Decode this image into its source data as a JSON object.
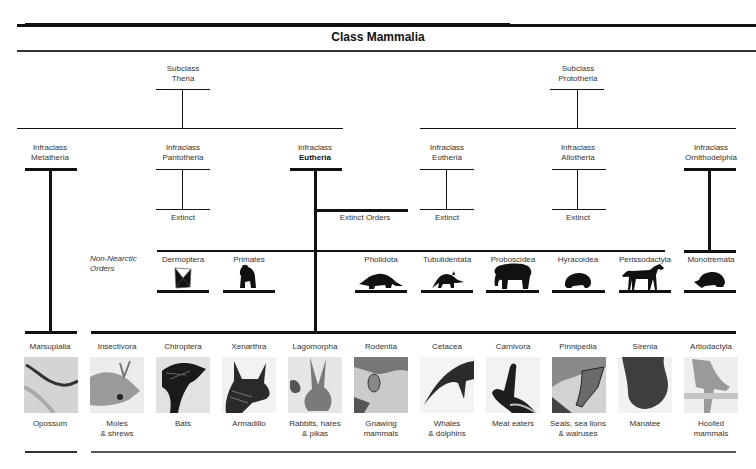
{
  "title": "Class Mammalia",
  "subclasses": [
    {
      "prefix": "Subclass",
      "name": "Theria"
    },
    {
      "prefix": "Subclass",
      "name": "Prototheria"
    }
  ],
  "infraclasses": [
    {
      "prefix": "Infraclass",
      "name": "Metatheria"
    },
    {
      "prefix": "Infraclass",
      "name": "Pantotheria",
      "note": "Extinct"
    },
    {
      "prefix": "Infraclass",
      "name": "Eutheria",
      "note": "Extinct Orders"
    },
    {
      "prefix": "Infraclass",
      "name": "Eotheria",
      "note": "Extinct"
    },
    {
      "prefix": "Infraclass",
      "name": "Allotheria",
      "note": "Extinct"
    },
    {
      "prefix": "Infraclass",
      "name": "Ornithodelphia"
    }
  ],
  "non_nearctic": {
    "label_line1": "Non-Nearctic",
    "label_line2": "Orders",
    "orders": [
      {
        "name": "Dermoptera",
        "icon": "colugo-icon"
      },
      {
        "name": "Primates",
        "icon": "gorilla-icon"
      },
      {
        "name": "Pholidota",
        "icon": "pangolin-icon"
      },
      {
        "name": "Tubulidentata",
        "icon": "aardvark-icon"
      },
      {
        "name": "Proboscidea",
        "icon": "elephant-icon"
      },
      {
        "name": "Hyracoidea",
        "icon": "hyrax-icon"
      },
      {
        "name": "Perissodactyla",
        "icon": "horse-icon"
      },
      {
        "name": "Monotremata",
        "icon": "echidna-icon"
      }
    ]
  },
  "nearctic_orders": [
    {
      "name": "Marsupialia",
      "common_line1": "Opossum",
      "common_line2": "",
      "image": "opossum-photo"
    },
    {
      "name": "Insectivora",
      "common_line1": "Moles",
      "common_line2": "& shrews",
      "image": "shrew-photo"
    },
    {
      "name": "Chiroptera",
      "common_line1": "Bats",
      "common_line2": "",
      "image": "bat-photo"
    },
    {
      "name": "Xenarthra",
      "common_line1": "Armadillo",
      "common_line2": "",
      "image": "armadillo-photo"
    },
    {
      "name": "Lagomorpha",
      "common_line1": "Rabbits, hares",
      "common_line2": "& pikas",
      "image": "rabbit-photo"
    },
    {
      "name": "Rodentia",
      "common_line1": "Gnawing",
      "common_line2": "mammals",
      "image": "rodent-photo"
    },
    {
      "name": "Cetacea",
      "common_line1": "Whales",
      "common_line2": "& dolphins",
      "image": "whale-photo"
    },
    {
      "name": "Carnivora",
      "common_line1": "Meat eaters",
      "common_line2": "",
      "image": "carnivore-photo"
    },
    {
      "name": "Pinnipedia",
      "common_line1": "Seals, sea lions",
      "common_line2": "& walruses",
      "image": "seal-photo"
    },
    {
      "name": "Sirenia",
      "common_line1": "Manatee",
      "common_line2": "",
      "image": "manatee-photo"
    },
    {
      "name": "Artiodactyla",
      "common_line1": "Hoofed",
      "common_line2": "mammals",
      "image": "hoofed-photo"
    }
  ]
}
